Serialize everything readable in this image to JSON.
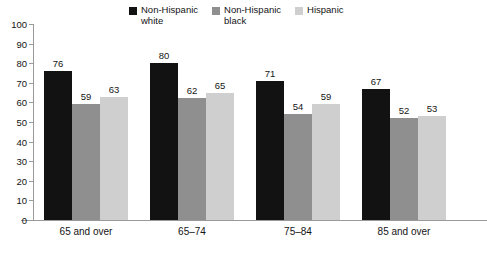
{
  "chart_data": {
    "type": "bar",
    "title": "",
    "subtitle": "",
    "xlabel": "",
    "ylabel": "",
    "ylim": [
      0,
      100
    ],
    "yticks": [
      0,
      10,
      20,
      30,
      40,
      50,
      60,
      70,
      80,
      90,
      100
    ],
    "grid": false,
    "legend_position": "top",
    "categories": [
      "65 and over",
      "65–74",
      "75–84",
      "85 and over"
    ],
    "series": [
      {
        "name": "Non-Hispanic\nwhite",
        "color": "#121212",
        "values": [
          76,
          80,
          71,
          67
        ]
      },
      {
        "name": "Non-Hispanic\nblack",
        "color": "#8f8f8f",
        "values": [
          59,
          62,
          54,
          52
        ]
      },
      {
        "name": "Hispanic",
        "color": "#cfcfcf",
        "values": [
          63,
          65,
          59,
          53
        ]
      }
    ]
  },
  "axis": {
    "line_color": "#9a9a9a"
  }
}
